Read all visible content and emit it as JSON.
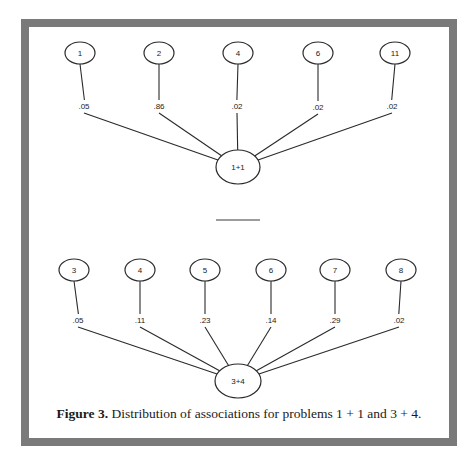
{
  "figure": {
    "caption_label": "Figure 3.",
    "caption_text": " Distribution of associations for problems 1 + 1 and 3 + 4.",
    "colors": {
      "frame": "#7a7a7a",
      "line": "#2a2a2a",
      "background": "#ffffff"
    }
  },
  "diagrams": [
    {
      "problem": "1+1",
      "center": {
        "x": 238,
        "y": 167,
        "rx": 22,
        "ry": 17
      },
      "answers": [
        {
          "label": "1",
          "probability": ".05",
          "node": {
            "x": 80,
            "y": 53
          },
          "prob_pos": {
            "x": 84,
            "y": 106
          }
        },
        {
          "label": "2",
          "probability": ".86",
          "node": {
            "x": 159,
            "y": 53
          },
          "prob_pos": {
            "x": 159,
            "y": 106
          }
        },
        {
          "label": "4",
          "probability": ".02",
          "node": {
            "x": 238,
            "y": 53
          },
          "prob_pos": {
            "x": 237,
            "y": 106
          }
        },
        {
          "label": "6",
          "probability": ".02",
          "node": {
            "x": 318,
            "y": 53
          },
          "prob_pos": {
            "x": 318,
            "y": 107
          }
        },
        {
          "label": "11",
          "probability": ".02",
          "node": {
            "x": 395,
            "y": 53
          },
          "prob_pos": {
            "x": 392,
            "y": 106
          }
        }
      ]
    },
    {
      "problem": "3+4",
      "center": {
        "x": 238,
        "y": 381,
        "rx": 23,
        "ry": 17
      },
      "answers": [
        {
          "label": "3",
          "probability": ".05",
          "node": {
            "x": 74,
            "y": 270
          },
          "prob_pos": {
            "x": 78,
            "y": 320
          }
        },
        {
          "label": "4",
          "probability": ".11",
          "node": {
            "x": 140,
            "y": 270
          },
          "prob_pos": {
            "x": 140,
            "y": 320
          }
        },
        {
          "label": "5",
          "probability": ".23",
          "node": {
            "x": 205,
            "y": 270
          },
          "prob_pos": {
            "x": 205,
            "y": 320
          }
        },
        {
          "label": "6",
          "probability": ".14",
          "node": {
            "x": 271,
            "y": 270
          },
          "prob_pos": {
            "x": 271,
            "y": 320
          }
        },
        {
          "label": "7",
          "probability": ".29",
          "node": {
            "x": 335,
            "y": 270
          },
          "prob_pos": {
            "x": 335,
            "y": 320
          }
        },
        {
          "label": "8",
          "probability": ".02",
          "node": {
            "x": 401,
            "y": 270
          },
          "prob_pos": {
            "x": 399,
            "y": 320
          }
        }
      ]
    }
  ],
  "separator": {
    "x1": 216,
    "x2": 260,
    "y": 220
  }
}
